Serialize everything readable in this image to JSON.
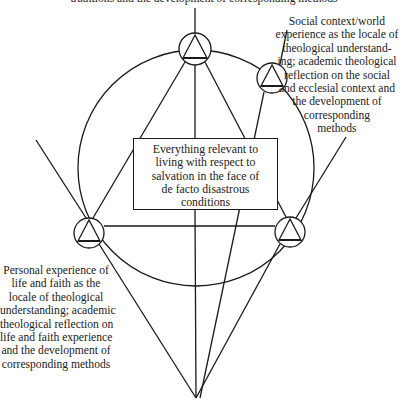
{
  "diagram": {
    "type": "conceptual-diagram",
    "top_label": {
      "lines": [
        "traditions and the development of corresponding methods"
      ]
    },
    "right_label": {
      "lines": [
        "Social context/world",
        "experience as the locale of",
        "theological understand-",
        "ing; academic theological",
        "reflection on the social",
        "and ecclesial context and",
        "the development of",
        "corresponding",
        "methods"
      ]
    },
    "left_label": {
      "lines": [
        "Personal experience of",
        "life and faith as the",
        "locale of theological",
        "understanding; academic",
        "theological reflection on",
        "life and faith experience",
        "and the development of",
        "corresponding methods"
      ]
    },
    "center_box": {
      "lines": [
        "Everything relevant to",
        "living with respect to",
        "salvation in the face of",
        "de facto disastrous",
        "conditions"
      ]
    },
    "nodes": [
      {
        "id": "top",
        "x": 195,
        "y": 49,
        "r": 16,
        "symbol": "triangle-in-circle"
      },
      {
        "id": "upper-right",
        "x": 272,
        "y": 78,
        "r": 15,
        "symbol": "triangle-in-circle"
      },
      {
        "id": "left",
        "x": 89,
        "y": 233,
        "r": 15,
        "symbol": "triangle-in-circle"
      },
      {
        "id": "right",
        "x": 290,
        "y": 232,
        "r": 15,
        "symbol": "triangle-in-circle"
      }
    ],
    "apex": {
      "x": 196,
      "y": 398
    },
    "big_circle": {
      "cx": 196,
      "cy": 168,
      "r": 118
    },
    "colors": {
      "stroke": "#1a1a1a",
      "background": "#ffffff",
      "text": "#222222"
    }
  }
}
